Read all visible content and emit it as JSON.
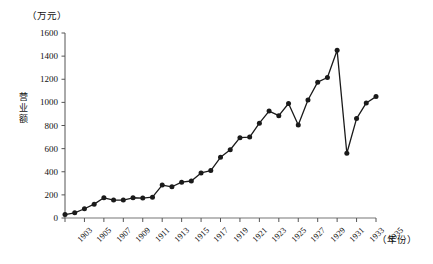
{
  "chart_data": {
    "type": "line",
    "title": "",
    "xlabel": "（年份）",
    "ylabel": "营业额",
    "yunit": "（万元）",
    "ylim": [
      0,
      1600
    ],
    "ytick_step": 200,
    "yticks": [
      0,
      200,
      400,
      600,
      800,
      1000,
      1200,
      1400,
      1600
    ],
    "ytick_labels": [
      "0",
      "200",
      "400",
      "600",
      "800",
      "1000",
      "1200",
      "1400",
      "1600"
    ],
    "xlim": [
      1903,
      1935
    ],
    "xticks": [
      1903,
      1905,
      1907,
      1909,
      1911,
      1913,
      1915,
      1917,
      1919,
      1921,
      1923,
      1925,
      1927,
      1929,
      1931,
      1933,
      1935
    ],
    "xtick_labels": [
      "1903",
      "1905",
      "1907",
      "1909",
      "1911",
      "1913",
      "1915",
      "1917",
      "1919",
      "1921",
      "1923",
      "1925",
      "1927",
      "1929",
      "1931",
      "1933",
      "1935"
    ],
    "grid": false,
    "legend": false,
    "marker": "filled-circle",
    "line_color": "#1a1a1a",
    "marker_color": "#1a1a1a",
    "axis_color": "#555555",
    "x": [
      1903,
      1904,
      1905,
      1906,
      1907,
      1908,
      1909,
      1910,
      1911,
      1912,
      1913,
      1914,
      1915,
      1916,
      1917,
      1918,
      1919,
      1920,
      1921,
      1922,
      1923,
      1924,
      1925,
      1926,
      1927,
      1928,
      1929,
      1930,
      1931,
      1932,
      1933,
      1934,
      1935
    ],
    "values": [
      30,
      45,
      80,
      120,
      175,
      155,
      155,
      175,
      172,
      180,
      285,
      270,
      310,
      320,
      390,
      410,
      525,
      590,
      695,
      700,
      820,
      925,
      885,
      990,
      805,
      1020,
      1175,
      1215,
      1450,
      560,
      860,
      995,
      1050
    ]
  }
}
